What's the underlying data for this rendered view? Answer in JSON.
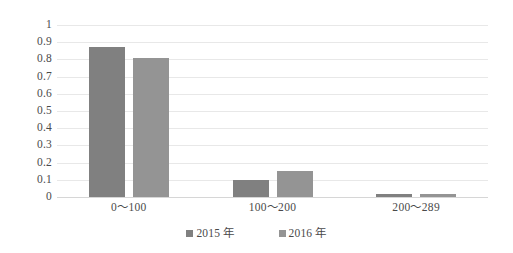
{
  "chart_data": {
    "type": "bar",
    "title": "",
    "subtitle": "",
    "xlabel": "",
    "ylabel": "",
    "categories": [
      "0～100",
      "100～200",
      "200～289"
    ],
    "series": [
      {
        "name": "2015 年",
        "color": "#808080",
        "values": [
          0.87,
          0.1,
          0.015
        ]
      },
      {
        "name": "2016 年",
        "color": "#949494",
        "values": [
          0.81,
          0.15,
          0.015
        ]
      }
    ],
    "ylim": [
      0,
      1
    ],
    "ytick_step": 0.1,
    "ytick_labels": [
      "1",
      "0.9",
      "0.8",
      "0.7",
      "0.6",
      "0.5",
      "0.4",
      "0.3",
      "0.2",
      "0.1",
      "0"
    ],
    "ytick_values": [
      1,
      0.9,
      0.8,
      0.7,
      0.6,
      0.5,
      0.4,
      0.3,
      0.2,
      0.1,
      0
    ],
    "grid": true,
    "grid_axis": "y",
    "grid_color": "#e8e8e8",
    "legend_position": "bottom",
    "background_color": "#ffffff",
    "text_color": "#4a4a4a"
  }
}
